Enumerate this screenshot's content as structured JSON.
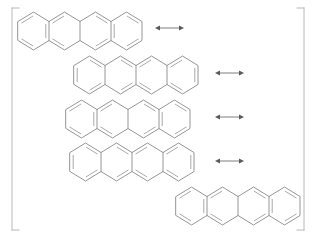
{
  "figure": {
    "kind": "chemical-resonance-diagram",
    "molecule_name": "tetracene",
    "rings_per_structure": 4,
    "structure_count": 5,
    "arrow_count": 4,
    "arrow_symbol": "↔",
    "bracket_left_symbol": "[",
    "bracket_right_symbol": "]",
    "background_color": "#ffffff",
    "bond_color": "#8a8a8a",
    "inner_bond_color": "#9a9a9a",
    "bracket_color": "#b8b8b8",
    "arrow_color": "#5a5a5a"
  },
  "brackets": {
    "left": {
      "x": 12,
      "y_top": 8,
      "y_bottom": 230,
      "serif": 7
    },
    "right": {
      "x": 304,
      "y_top": 8,
      "y_bottom": 230,
      "serif": 7
    }
  },
  "structures": [
    {
      "id": "structure-1",
      "label": "tetracene-resonance-1",
      "origin_x": 18,
      "origin_y": 12,
      "ring_width": 31,
      "ring_height": 38,
      "double_bond_pattern": "A"
    },
    {
      "id": "structure-2",
      "label": "tetracene-resonance-2",
      "origin_x": 74,
      "origin_y": 56,
      "ring_width": 31,
      "ring_height": 38,
      "double_bond_pattern": "B"
    },
    {
      "id": "structure-3",
      "label": "tetracene-resonance-3",
      "origin_x": 66,
      "origin_y": 100,
      "ring_width": 31,
      "ring_height": 38,
      "double_bond_pattern": "A"
    },
    {
      "id": "structure-4",
      "label": "tetracene-resonance-4",
      "origin_x": 70,
      "origin_y": 143,
      "ring_width": 31,
      "ring_height": 38,
      "double_bond_pattern": "B"
    },
    {
      "id": "structure-5",
      "label": "tetracene-resonance-5",
      "origin_x": 176,
      "origin_y": 187,
      "ring_width": 31,
      "ring_height": 38,
      "double_bond_pattern": "A"
    }
  ],
  "arrows": [
    {
      "id": "arrow-1",
      "label": "resonance-arrow-1",
      "x1": 155,
      "x2": 184,
      "y": 28
    },
    {
      "id": "arrow-2",
      "label": "resonance-arrow-2",
      "x1": 215,
      "x2": 244,
      "y": 73
    },
    {
      "id": "arrow-3",
      "label": "resonance-arrow-3",
      "x1": 215,
      "x2": 244,
      "y": 117
    },
    {
      "id": "arrow-4",
      "label": "resonance-arrow-4",
      "x1": 215,
      "x2": 244,
      "y": 161
    }
  ]
}
